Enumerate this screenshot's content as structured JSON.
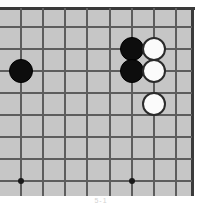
{
  "diagram": {
    "board_color": "#c6c6c6",
    "line_color": "#5d5d5d",
    "border_color": "#3a3a3a",
    "black_stone_color": "#0d0d0d",
    "white_stone_color": "#fbfbfb",
    "page_background": "#ffffff",
    "caption": "5-1",
    "grid": {
      "vertical_line_x": [
        21,
        43,
        65,
        87,
        110,
        132,
        154,
        176
      ],
      "horizontal_line_y": [
        27,
        49,
        71,
        93,
        115,
        137,
        159,
        181
      ],
      "spacing_px": 22,
      "cropped_edges": [
        "left",
        "bottom"
      ]
    },
    "star_points": [
      {
        "name": "star-point-left",
        "x": 21,
        "y": 181
      },
      {
        "name": "star-point-right",
        "x": 132,
        "y": 181
      }
    ],
    "stones": [
      {
        "name": "black-stone-left",
        "color": "black",
        "x": 21,
        "y": 71
      },
      {
        "name": "black-stone-upper",
        "color": "black",
        "x": 132,
        "y": 49
      },
      {
        "name": "black-stone-lower",
        "color": "black",
        "x": 132,
        "y": 71
      },
      {
        "name": "white-stone-upper",
        "color": "white",
        "x": 154,
        "y": 49
      },
      {
        "name": "white-stone-lower",
        "color": "white",
        "x": 154,
        "y": 71
      },
      {
        "name": "white-stone-isolated",
        "color": "white",
        "x": 154,
        "y": 104
      }
    ],
    "counts": {
      "black_stones": 3,
      "white_stones": 3,
      "total_stones": 6
    }
  }
}
